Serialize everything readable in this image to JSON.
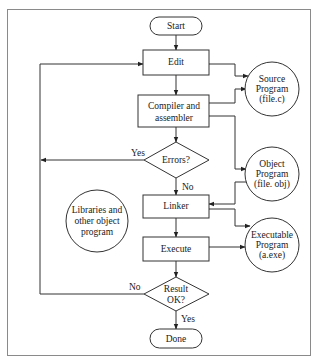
{
  "diagram": {
    "type": "flowchart",
    "title": "",
    "nodes": {
      "start": {
        "label": "Start",
        "shape": "terminator"
      },
      "edit": {
        "label": "Edit",
        "shape": "process"
      },
      "compile": {
        "label_line1": "Compiler and",
        "label_line2": "assembler",
        "shape": "process"
      },
      "errors": {
        "label": "Errors?",
        "shape": "decision"
      },
      "linker": {
        "label": "Linker",
        "shape": "process"
      },
      "execute": {
        "label": "Execute",
        "shape": "process"
      },
      "result": {
        "label_line1": "Result",
        "label_line2": "OK?",
        "shape": "decision"
      },
      "done": {
        "label": "Done",
        "shape": "terminator"
      },
      "source": {
        "label_line1": "Source",
        "label_line2": "Program",
        "label_line3": "(file.c)",
        "shape": "circle"
      },
      "object": {
        "label_line1": "Object",
        "label_line2": "Program",
        "label_line3": "(file. obj)",
        "shape": "circle"
      },
      "executable": {
        "label_line1": "Executable",
        "label_line2": "Program",
        "label_line3": "(a.exe)",
        "shape": "circle"
      },
      "libraries": {
        "label_line1": "Libraries and",
        "label_line2": "other object",
        "label_line3": "program",
        "shape": "circle"
      }
    },
    "edge_labels": {
      "errors_yes": "Yes",
      "errors_no": "No",
      "result_no": "No",
      "result_yes": "Yes"
    },
    "edges": [
      {
        "from": "start",
        "to": "edit"
      },
      {
        "from": "edit",
        "to": "compile"
      },
      {
        "from": "compile",
        "to": "errors"
      },
      {
        "from": "errors",
        "to": "edit",
        "label": "Yes"
      },
      {
        "from": "errors",
        "to": "linker",
        "label": "No"
      },
      {
        "from": "linker",
        "to": "execute"
      },
      {
        "from": "execute",
        "to": "result"
      },
      {
        "from": "result",
        "to": "edit",
        "label": "No"
      },
      {
        "from": "result",
        "to": "done",
        "label": "Yes"
      },
      {
        "from": "edit",
        "to": "source",
        "bidirectional": true
      },
      {
        "from": "source",
        "to": "compile"
      },
      {
        "from": "compile",
        "to": "object"
      },
      {
        "from": "object",
        "to": "linker"
      },
      {
        "from": "linker",
        "to": "executable"
      },
      {
        "from": "executable",
        "to": "execute"
      }
    ],
    "colors": {
      "stroke": "#333333",
      "frame": "#888888",
      "background": "#ffffff"
    }
  }
}
